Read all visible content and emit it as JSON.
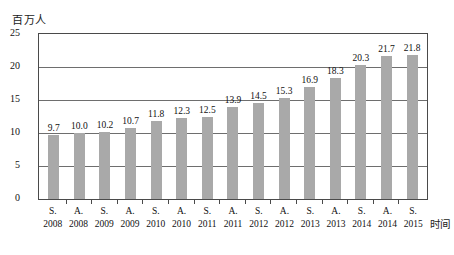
{
  "chart_data": {
    "type": "bar",
    "title": "",
    "subtitle": "",
    "xlabel": "时间",
    "ylabel": "百万人",
    "ylim": [
      0,
      25
    ],
    "yticks": [
      "0",
      "5",
      "10",
      "15",
      "20",
      "25"
    ],
    "grid": true,
    "legend": false,
    "legend_position": "none",
    "bar_color": "#a9a9a9",
    "categories": [
      "S. 2008",
      "A. 2008",
      "S. 2009",
      "A. 2009",
      "S. 2010",
      "A. 2010",
      "S. 2011",
      "A. 2011",
      "S. 2012",
      "A. 2012",
      "S. 2013",
      "A. 2013",
      "S. 2014",
      "A. 2014",
      "S. 2015"
    ],
    "category_seasons": [
      "S.",
      "A.",
      "S.",
      "A.",
      "S.",
      "A.",
      "S.",
      "A.",
      "S.",
      "A.",
      "S.",
      "A.",
      "S.",
      "A.",
      "S."
    ],
    "category_years": [
      "2008",
      "2008",
      "2009",
      "2009",
      "2010",
      "2010",
      "2011",
      "2011",
      "2012",
      "2012",
      "2013",
      "2013",
      "2014",
      "2014",
      "2015"
    ],
    "values": [
      9.7,
      10.0,
      10.2,
      10.7,
      11.8,
      12.3,
      12.5,
      13.9,
      14.5,
      15.3,
      16.9,
      18.3,
      20.3,
      21.7,
      21.8
    ],
    "value_labels": [
      "9.7",
      "10.0",
      "10.2",
      "10.7",
      "11.8",
      "12.3",
      "12.5",
      "13.9",
      "14.5",
      "15.3",
      "16.9",
      "18.3",
      "20.3",
      "21.7",
      "21.8"
    ]
  }
}
